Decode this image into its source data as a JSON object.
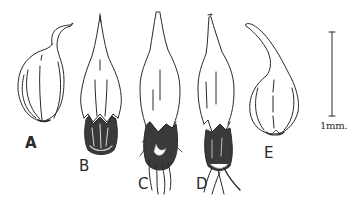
{
  "figure": {
    "type": "botanical line illustration",
    "panels": [
      {
        "id": "A",
        "label": "A"
      },
      {
        "id": "B",
        "label": "B"
      },
      {
        "id": "C",
        "label": "C"
      },
      {
        "id": "D",
        "label": "D"
      },
      {
        "id": "E",
        "label": "E"
      }
    ],
    "scale_bar": {
      "label": "1mm."
    }
  },
  "colors": {
    "ink": "#2a2a2a",
    "shade": "#3a3a3a",
    "background": "#ffffff"
  }
}
